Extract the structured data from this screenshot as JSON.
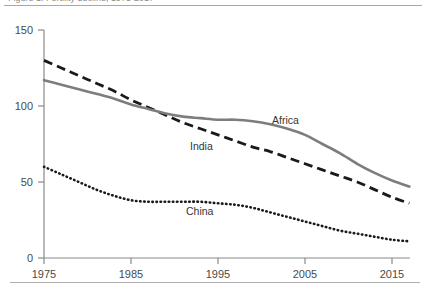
{
  "figure": {
    "caption_sliver": "Figure 1. Fertility decline, 1975-2017",
    "background": "#ffffff"
  },
  "axes": {
    "y_ticks": [
      "150",
      "100",
      "50",
      "0"
    ],
    "x_ticks": [
      "1975",
      "1985",
      "1995",
      "2005",
      "2015"
    ],
    "axis_color": "#8a8a8a"
  },
  "series_labels": {
    "africa": "Africa",
    "india": "India",
    "china": "China"
  },
  "colors": {
    "africa": "#7d7d7d",
    "india": "#1a1a1a",
    "china": "#1a1a1a",
    "axis": "#8a8a8a",
    "text": "#3a3a3a"
  },
  "chart_data": {
    "type": "line",
    "title": "",
    "xlabel": "",
    "ylabel": "",
    "xlim": [
      1975,
      2017
    ],
    "ylim": [
      0,
      150
    ],
    "y_ticks": [
      0,
      50,
      100,
      150
    ],
    "x_ticks": [
      1975,
      1985,
      1995,
      2005,
      2015
    ],
    "grid": false,
    "legend": "inline-annotations",
    "x": [
      1975,
      1977,
      1979,
      1981,
      1983,
      1985,
      1987,
      1989,
      1991,
      1993,
      1995,
      1997,
      1999,
      2001,
      2003,
      2005,
      2007,
      2009,
      2011,
      2013,
      2015,
      2017
    ],
    "series": [
      {
        "name": "Africa",
        "style": "solid",
        "color": "#7d7d7d",
        "values": [
          117,
          114,
          111,
          108,
          105,
          101,
          98,
          95,
          93,
          92,
          91,
          91,
          90,
          88,
          85,
          81,
          75,
          69,
          62,
          56,
          51,
          47
        ]
      },
      {
        "name": "India",
        "style": "dashed",
        "color": "#1a1a1a",
        "values": [
          130,
          125,
          120,
          115,
          110,
          104,
          99,
          94,
          89,
          85,
          81,
          77,
          73,
          70,
          66,
          62,
          58,
          54,
          50,
          45,
          40,
          36
        ]
      },
      {
        "name": "China",
        "style": "dotted",
        "color": "#1a1a1a",
        "values": [
          60,
          55,
          50,
          45,
          41,
          38,
          37,
          37,
          37,
          37,
          36,
          35,
          33,
          30,
          27,
          24,
          21,
          18,
          16,
          14,
          12,
          11
        ]
      }
    ]
  }
}
